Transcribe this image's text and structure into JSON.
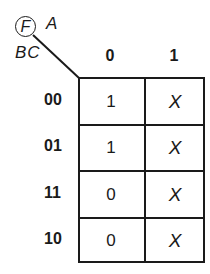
{
  "kmap": {
    "function_label": "F",
    "column_variable": "A",
    "row_variables": "BC",
    "columns": [
      "0",
      "1"
    ],
    "rows": [
      {
        "label": "00",
        "cells": [
          "1",
          "X"
        ]
      },
      {
        "label": "01",
        "cells": [
          "1",
          "X"
        ]
      },
      {
        "label": "11",
        "cells": [
          "0",
          "X"
        ]
      },
      {
        "label": "10",
        "cells": [
          "0",
          "X"
        ]
      }
    ]
  }
}
